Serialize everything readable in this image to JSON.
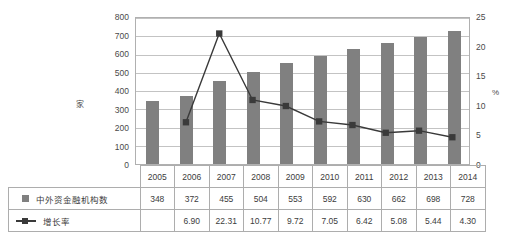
{
  "chart_data": {
    "type": "bar",
    "title": "",
    "xlabel": "",
    "ylabel": "家",
    "y2label": "%",
    "ylim": [
      0,
      800
    ],
    "y2lim": [
      0,
      25
    ],
    "grid": true,
    "legend_position": "table-below",
    "categories": [
      "2005",
      "2006",
      "2007",
      "2008",
      "2009",
      "2010",
      "2011",
      "2012",
      "2013",
      "2014"
    ],
    "series": [
      {
        "name": "中外资金融机构数",
        "type": "bar",
        "axis": "left",
        "color": "#808080",
        "values": [
          348,
          372,
          455,
          504,
          553,
          592,
          630,
          662,
          698,
          728
        ],
        "labels": [
          "348",
          "372",
          "455",
          "504",
          "553",
          "592",
          "630",
          "662",
          "698",
          "728"
        ]
      },
      {
        "name": "增长率",
        "type": "line",
        "axis": "right",
        "color": "#3a3a3a",
        "values": [
          null,
          6.9,
          22.31,
          10.77,
          9.72,
          7.05,
          6.42,
          5.08,
          5.44,
          4.3
        ],
        "labels": [
          "",
          "6.90",
          "22.31",
          "10.77",
          "9.72",
          "7.05",
          "6.42",
          "5.08",
          "5.44",
          "4.30"
        ]
      }
    ],
    "left_ticks": [
      "800",
      "700",
      "600",
      "500",
      "400",
      "300",
      "200",
      "100",
      "0"
    ],
    "right_ticks": [
      "25",
      "20",
      "15",
      "10",
      "5",
      "0"
    ]
  },
  "axes": {
    "left_label": "家",
    "right_label": "%"
  },
  "table": {
    "year_header": [
      "2005",
      "2006",
      "2007",
      "2008",
      "2009",
      "2010",
      "2011",
      "2012",
      "2013",
      "2014"
    ],
    "rows": [
      {
        "legend_label": "中外资金融机构数",
        "marker": "square-swatch",
        "values": [
          "348",
          "372",
          "455",
          "504",
          "553",
          "592",
          "630",
          "662",
          "698",
          "728"
        ]
      },
      {
        "legend_label": "增长率",
        "marker": "line-marker",
        "values": [
          "",
          "6.90",
          "22.31",
          "10.77",
          "9.72",
          "7.05",
          "6.42",
          "5.08",
          "5.44",
          "4.30"
        ]
      }
    ]
  }
}
